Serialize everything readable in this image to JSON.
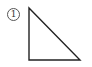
{
  "figure": {
    "label": "1",
    "shape": "right-triangle",
    "stroke_color": "#222222",
    "vertices": [
      [
        29,
        8
      ],
      [
        29,
        60
      ],
      [
        80,
        60
      ]
    ]
  }
}
